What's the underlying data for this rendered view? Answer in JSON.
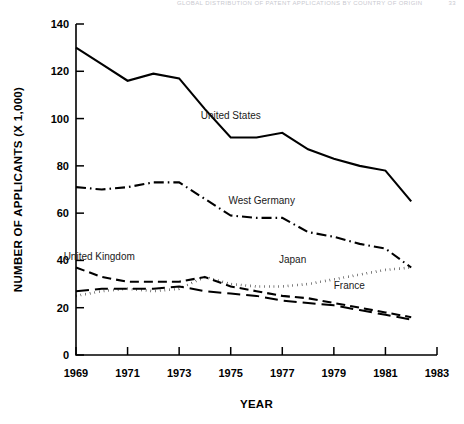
{
  "header": {
    "title": "GLOBAL DISTRIBUTION OF PATENT APPLICATIONS BY COUNTRY OF ORIGIN",
    "page_number": "33"
  },
  "chart_data": {
    "type": "line",
    "title": "",
    "xlabel": "YEAR",
    "ylabel": "NUMBER OF APPLICANTS (X 1,000)",
    "xlim": [
      1969,
      1983
    ],
    "ylim": [
      0,
      140
    ],
    "xticks": [
      1969,
      1971,
      1973,
      1975,
      1977,
      1979,
      1981,
      1983
    ],
    "xticklabels": [
      "1969",
      "1971",
      "1973",
      "1975",
      "1977",
      "1979",
      "1981",
      "1983"
    ],
    "yticks": [
      0,
      20,
      40,
      60,
      80,
      100,
      120,
      140
    ],
    "yticklabels": [
      "0",
      "20",
      "40",
      "60",
      "80",
      "100",
      "120",
      "140"
    ],
    "grid": false,
    "legend": "inline-annotations",
    "x": [
      1969,
      1970,
      1971,
      1972,
      1973,
      1974,
      1975,
      1976,
      1977,
      1978,
      1979,
      1980,
      1981,
      1982
    ],
    "series": [
      {
        "name": "United States",
        "label": "United States",
        "style": "solid",
        "color": "#000000",
        "values": [
          130,
          123,
          116,
          119,
          117,
          104,
          92,
          92,
          94,
          87,
          83,
          80,
          78,
          65
        ],
        "label_x": 1975.0,
        "label_y": 100
      },
      {
        "name": "West Germany",
        "label": "West Germany",
        "style": "dashdot",
        "color": "#000000",
        "values": [
          71,
          70,
          71,
          73,
          73,
          66,
          59,
          58,
          58,
          52,
          50,
          47,
          45,
          37
        ],
        "label_x": 1976.2,
        "label_y": 64
      },
      {
        "name": "United Kingdom",
        "label": "United Kingdom",
        "style": "dashed",
        "color": "#000000",
        "values": [
          37,
          33,
          31,
          31,
          31,
          33,
          29,
          27,
          25,
          24,
          22,
          20,
          18,
          16
        ],
        "label_x": 1969.9,
        "label_y": 40
      },
      {
        "name": "Japan",
        "label": "Japan",
        "style": "dotted",
        "color": "#000000",
        "values": [
          25,
          27,
          28,
          27,
          28,
          33,
          30,
          29,
          29,
          30,
          32,
          34,
          36,
          37
        ],
        "label_x": 1977.4,
        "label_y": 39
      },
      {
        "name": "France",
        "label": "France",
        "style": "longdash",
        "color": "#000000",
        "values": [
          27,
          28,
          28,
          28,
          29,
          27,
          26,
          25,
          23,
          22,
          21,
          19,
          17,
          15
        ],
        "label_x": 1979.6,
        "label_y": 28
      }
    ]
  }
}
